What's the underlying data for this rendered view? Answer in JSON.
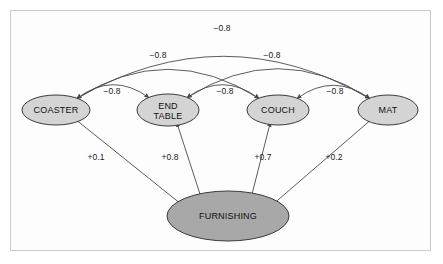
{
  "figure": {
    "type": "causal-network-diagram",
    "background_color": "#ffffff",
    "frame_color": "#c9c9c9",
    "node_fill": "#d4d4d4",
    "root_fill": "#a8a8a8",
    "node_stroke": "#3a3a3a",
    "edge_stroke": "#4a4a4a"
  },
  "nodes": [
    {
      "id": "coaster",
      "label": "COASTER",
      "label_line1": "COASTER",
      "label_line2": "",
      "cx": 56,
      "cy": 110,
      "rx": 34,
      "ry": 15,
      "kind": "effect"
    },
    {
      "id": "end_table",
      "label": "END TABLE",
      "label_line1": "END",
      "label_line2": "TABLE",
      "cx": 168,
      "cy": 110,
      "rx": 31,
      "ry": 16,
      "kind": "effect"
    },
    {
      "id": "couch",
      "label": "COUCH",
      "label_line1": "COUCH",
      "label_line2": "",
      "cx": 278,
      "cy": 110,
      "rx": 31,
      "ry": 15,
      "kind": "effect"
    },
    {
      "id": "mat",
      "label": "MAT",
      "label_line1": "MAT",
      "label_line2": "",
      "cx": 388,
      "cy": 110,
      "rx": 30,
      "ry": 15,
      "kind": "effect"
    },
    {
      "id": "furnishing",
      "label": "FURNISHING",
      "label_line1": "FURNISHING",
      "label_line2": "",
      "cx": 228,
      "cy": 216,
      "rx": 61,
      "ry": 25,
      "kind": "cause"
    }
  ],
  "inhibitory_edges": [
    {
      "from": "coaster",
      "to": "end_table",
      "weight": "−0.8",
      "label_x": 112,
      "label_y": 94,
      "tier": 1
    },
    {
      "from": "end_table",
      "to": "couch",
      "weight": "−0.8",
      "label_x": 225,
      "label_y": 94,
      "tier": 1
    },
    {
      "from": "couch",
      "to": "mat",
      "weight": "−0.8",
      "label_x": 335,
      "label_y": 94,
      "tier": 1
    },
    {
      "from": "coaster",
      "to": "couch",
      "weight": "−0.8",
      "label_x": 158,
      "label_y": 58,
      "tier": 2
    },
    {
      "from": "end_table",
      "to": "mat",
      "weight": "−0.8",
      "label_x": 272,
      "label_y": 58,
      "tier": 2
    },
    {
      "from": "coaster",
      "to": "mat",
      "weight": "−0.8",
      "label_x": 222,
      "label_y": 31,
      "tier": 3
    }
  ],
  "excitatory_edges": [
    {
      "from": "furnishing",
      "to": "coaster",
      "weight": "+0.1",
      "label_x": 96,
      "label_y": 160
    },
    {
      "from": "furnishing",
      "to": "end_table",
      "weight": "+0.8",
      "label_x": 170,
      "label_y": 160
    },
    {
      "from": "furnishing",
      "to": "couch",
      "weight": "+0.7",
      "label_x": 263,
      "label_y": 160
    },
    {
      "from": "furnishing",
      "to": "mat",
      "weight": "+0.2",
      "label_x": 334,
      "label_y": 160
    }
  ]
}
